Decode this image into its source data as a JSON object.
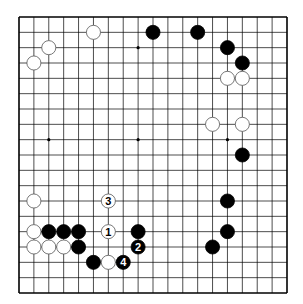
{
  "diagram": {
    "type": "go-board",
    "size": 19,
    "grid": {
      "x0": 19,
      "y0": 17,
      "x1": 287,
      "y1": 293
    },
    "colors": {
      "line": "#000000",
      "board": "#ffffff",
      "black": "#000000",
      "white": "#ffffff"
    },
    "star_points": [
      [
        3,
        3
      ],
      [
        9,
        3
      ],
      [
        15,
        3
      ],
      [
        3,
        9
      ],
      [
        9,
        9
      ],
      [
        15,
        9
      ],
      [
        3,
        15
      ],
      [
        9,
        15
      ],
      [
        15,
        15
      ]
    ],
    "stones": [
      {
        "c": 6,
        "r": 2,
        "color": "white"
      },
      {
        "c": 3,
        "r": 3,
        "color": "white"
      },
      {
        "c": 2,
        "r": 4,
        "color": "white"
      },
      {
        "c": 10,
        "r": 2,
        "color": "black"
      },
      {
        "c": 13,
        "r": 2,
        "color": "black"
      },
      {
        "c": 15,
        "r": 3,
        "color": "black"
      },
      {
        "c": 16,
        "r": 4,
        "color": "black"
      },
      {
        "c": 15,
        "r": 5,
        "color": "white"
      },
      {
        "c": 16,
        "r": 5,
        "color": "white"
      },
      {
        "c": 14,
        "r": 8,
        "color": "white"
      },
      {
        "c": 16,
        "r": 8,
        "color": "white"
      },
      {
        "c": 16,
        "r": 10,
        "color": "black"
      },
      {
        "c": 15,
        "r": 13,
        "color": "black"
      },
      {
        "c": 15,
        "r": 15,
        "color": "black"
      },
      {
        "c": 14,
        "r": 16,
        "color": "black"
      },
      {
        "c": 2,
        "r": 13,
        "color": "white"
      },
      {
        "c": 2,
        "r": 15,
        "color": "white"
      },
      {
        "c": 3,
        "r": 15,
        "color": "black"
      },
      {
        "c": 4,
        "r": 15,
        "color": "black"
      },
      {
        "c": 5,
        "r": 15,
        "color": "black"
      },
      {
        "c": 2,
        "r": 16,
        "color": "white"
      },
      {
        "c": 3,
        "r": 16,
        "color": "white"
      },
      {
        "c": 4,
        "r": 16,
        "color": "white"
      },
      {
        "c": 5,
        "r": 16,
        "color": "black"
      },
      {
        "c": 6,
        "r": 17,
        "color": "black"
      },
      {
        "c": 7,
        "r": 17,
        "color": "white"
      },
      {
        "c": 9,
        "r": 15,
        "color": "black"
      },
      {
        "c": 7,
        "r": 15,
        "color": "white",
        "label": "1"
      },
      {
        "c": 9,
        "r": 16,
        "color": "black",
        "label": "2"
      },
      {
        "c": 7,
        "r": 13,
        "color": "white",
        "label": "3"
      },
      {
        "c": 8,
        "r": 17,
        "color": "black",
        "label": "4"
      }
    ]
  }
}
